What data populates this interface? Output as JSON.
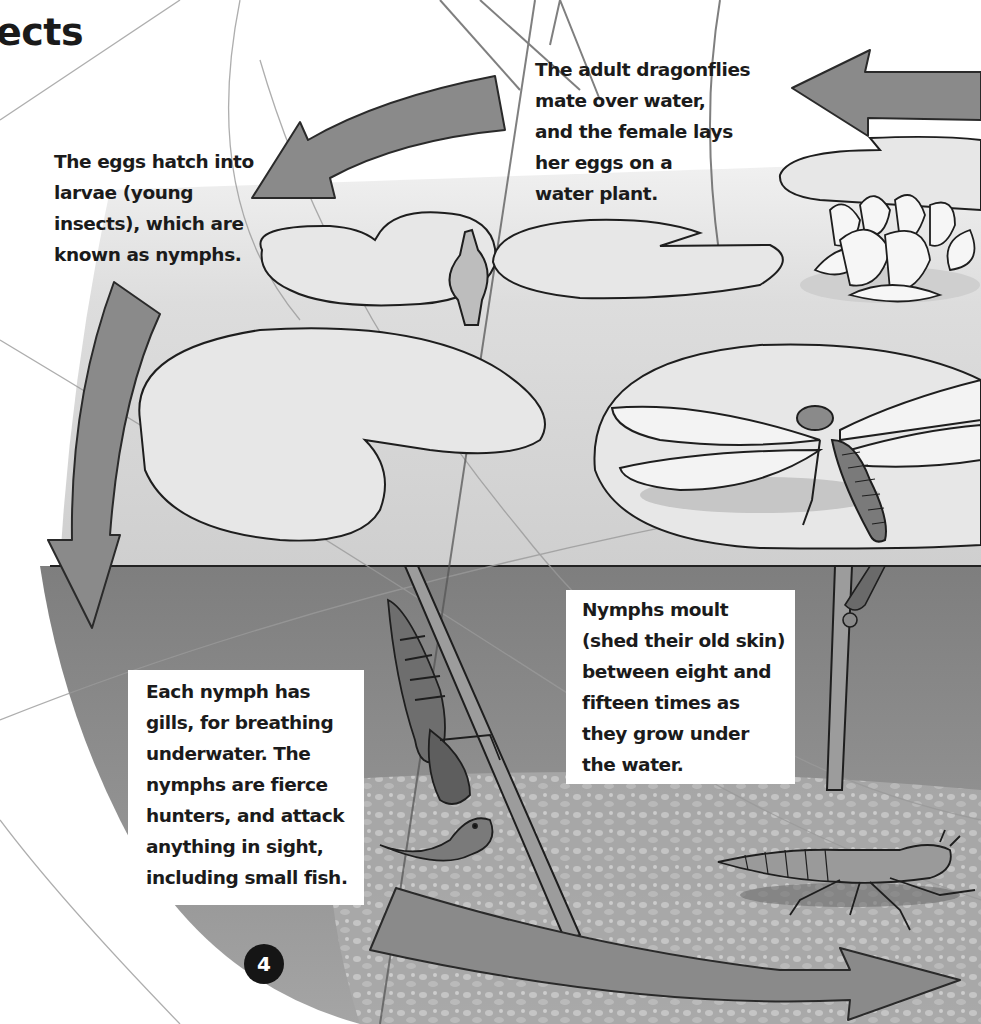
{
  "page": {
    "heading_fragment": "ects",
    "page_number": "4",
    "colors": {
      "arrow_fill": "#8a8a8a",
      "arrow_stroke": "#2a2a2a",
      "water_surface": "#d9d9d9",
      "underwater": "#8e8e8e",
      "pond_bed": "#b5b5b5",
      "text": "#1b1b1b"
    }
  },
  "captions": {
    "eggs_hatch": "The eggs hatch into\nlarvae (young\ninsects), which are\nknown as nymphs.",
    "adult_dragonflies": "The adult dragonflies\nmate over water,\nand the female lays\nher eggs on a\nwater plant.",
    "nymphs_moult": "Nymphs moult\n(shed their old skin)\nbetween eight and\nfifteen times as\nthey grow under\nthe water.",
    "each_nymph": "Each nymph has\ngills, for breathing\nunderwater. The\nnymphs are fierce\nhunters, and attack\nanything in sight,\nincluding small fish."
  },
  "illustration": {
    "elements": [
      "lily-pad",
      "water-lily-flower",
      "lily-bud",
      "adult-dragonfly",
      "nymph-on-stem",
      "emerging-nymph",
      "nymph-walking",
      "small-fish",
      "cycle-arrow-top-left",
      "cycle-arrow-left-down",
      "cycle-arrow-bottom-right",
      "cycle-arrow-top-right"
    ]
  }
}
